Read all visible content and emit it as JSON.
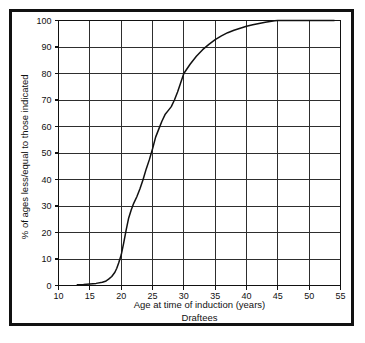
{
  "chart_data": {
    "type": "line",
    "title": "",
    "subtitle": "Draftees",
    "xlabel": "Age at time of induction (years)",
    "ylabel": "% of ages less/equal to those indicated",
    "xlim": [
      10,
      55
    ],
    "ylim": [
      0,
      100
    ],
    "grid": true,
    "legend": "none",
    "xticks": [
      10,
      15,
      20,
      25,
      30,
      35,
      40,
      45,
      50,
      55
    ],
    "yticks": [
      0,
      10,
      20,
      30,
      40,
      50,
      60,
      70,
      80,
      90,
      100
    ],
    "xtick_labels": [
      "10",
      "15",
      "20",
      "25",
      "30",
      "35",
      "40",
      "45",
      "50",
      "55"
    ],
    "ytick_labels": [
      "0",
      "10",
      "20",
      "30",
      "40",
      "50",
      "60",
      "70",
      "80",
      "90",
      "100"
    ],
    "series": [
      {
        "name": "Draftees cumulative age distribution",
        "color": "#111111",
        "x": [
          13.0,
          14.0,
          15.0,
          16.0,
          17.0,
          17.5,
          18.0,
          18.5,
          19.0,
          19.3,
          19.6,
          20.0,
          20.4,
          20.8,
          21.2,
          21.6,
          22.0,
          22.5,
          23.0,
          23.5,
          24.0,
          24.5,
          25.0,
          25.5,
          26.0,
          26.5,
          27.0,
          27.5,
          28.0,
          28.5,
          29.0,
          29.5,
          30.0,
          31.0,
          32.0,
          33.0,
          34.0,
          35.0,
          36.0,
          37.0,
          38.0,
          39.0,
          40.0,
          41.0,
          42.0,
          43.0,
          44.0,
          44.5,
          45.0,
          47.0,
          50.0,
          52.0,
          54.0
        ],
        "y": [
          0.3,
          0.4,
          0.6,
          0.8,
          1.2,
          1.6,
          2.4,
          3.4,
          5.0,
          6.5,
          8.5,
          11.5,
          16.0,
          21.0,
          25.5,
          28.5,
          31.0,
          33.5,
          36.5,
          40.0,
          44.0,
          47.5,
          51.5,
          56.0,
          59.0,
          62.0,
          64.5,
          66.0,
          67.5,
          70.0,
          73.0,
          76.5,
          80.0,
          83.5,
          86.5,
          89.0,
          91.0,
          92.8,
          94.2,
          95.4,
          96.3,
          97.1,
          97.8,
          98.4,
          98.9,
          99.3,
          99.7,
          99.9,
          100.0,
          100.0,
          100.0,
          100.0,
          100.0
        ]
      }
    ],
    "annotations": []
  }
}
